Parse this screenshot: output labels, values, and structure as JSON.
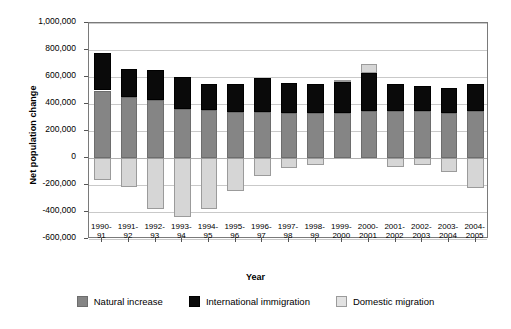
{
  "chart_data": {
    "type": "bar",
    "stacked": true,
    "title": "",
    "xlabel": "Year",
    "ylabel": "Net population change",
    "ylim": [
      -600000,
      1000000
    ],
    "ytick_step": 200000,
    "ytick_labels": [
      "1,000,000",
      "800,000",
      "600,000",
      "400,000",
      "200,000",
      "0",
      "-200,000",
      "-400,000",
      "-600,000"
    ],
    "ytick_values": [
      1000000,
      800000,
      600000,
      400000,
      200000,
      0,
      -200000,
      -400000,
      -600000
    ],
    "grid": true,
    "legend_position": "bottom",
    "categories": [
      "1990-\n91",
      "1991-\n92",
      "1992-\n93",
      "1993-\n94",
      "1994-\n95",
      "1995-\n96",
      "1996-\n97",
      "1997-\n98",
      "1998-\n99",
      "1999-\n2000",
      "2000-\n2001",
      "2001-\n2002",
      "2002-\n2003",
      "2003-\n2004",
      "2004-\n2005"
    ],
    "series": [
      {
        "name": "Natural increase",
        "color": "#858585",
        "values": [
          500000,
          450000,
          430000,
          365000,
          355000,
          340000,
          340000,
          330000,
          330000,
          335000,
          350000,
          345000,
          345000,
          335000,
          345000
        ]
      },
      {
        "name": "International immigration",
        "color": "#0a0a0a",
        "values": [
          280000,
          210000,
          225000,
          235000,
          190000,
          210000,
          255000,
          225000,
          215000,
          230000,
          280000,
          200000,
          190000,
          185000,
          200000
        ]
      },
      {
        "name": "Domestic migration",
        "color": "#d6d6d6",
        "values": [
          -160000,
          -215000,
          -375000,
          -435000,
          -375000,
          -245000,
          -130000,
          -75000,
          -55000,
          10000,
          70000,
          -65000,
          -55000,
          -100000,
          -220000
        ]
      }
    ]
  },
  "legend": {
    "items": [
      {
        "label": "Natural increase",
        "swatch": "natural"
      },
      {
        "label": "International immigration",
        "swatch": "intl"
      },
      {
        "label": "Domestic migration",
        "swatch": "dom"
      }
    ]
  }
}
